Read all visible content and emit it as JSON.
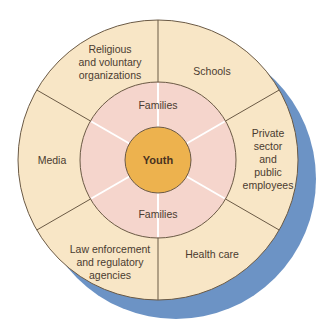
{
  "diagram": {
    "type": "concentric-sector-diagram",
    "colors": {
      "shadow": "#6C93C5",
      "outer_ring": "#F8E6C6",
      "middle_ring": "#F5D5CC",
      "center": "#EDB24E",
      "border": "#6B5A45",
      "middle_divider": "#FFFFFF"
    },
    "center": {
      "label": "Youth"
    },
    "middle_ring": {
      "labels": [
        "Families",
        "Families"
      ]
    },
    "outer_ring": {
      "sectors": [
        {
          "id": "religious",
          "lines": [
            "Religious",
            "and voluntary",
            "organizations"
          ]
        },
        {
          "id": "schools",
          "lines": [
            "Schools"
          ]
        },
        {
          "id": "private-sector",
          "lines": [
            "Private",
            "sector",
            "and",
            "public",
            "employees"
          ]
        },
        {
          "id": "health-care",
          "lines": [
            "Health care"
          ]
        },
        {
          "id": "law-enforcement",
          "lines": [
            "Law enforcement",
            "and regulatory",
            "agencies"
          ]
        },
        {
          "id": "media",
          "lines": [
            "Media"
          ]
        }
      ]
    }
  }
}
